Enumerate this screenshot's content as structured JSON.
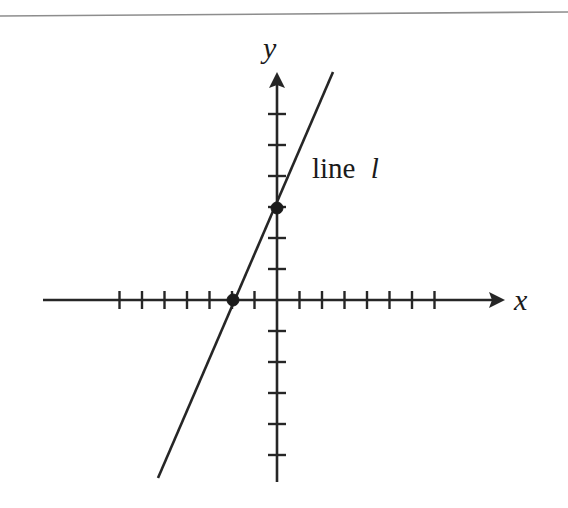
{
  "figure": {
    "kind": "coordinate-plane-line-graph",
    "background_color": "#ffffff",
    "ink_color": "#262626",
    "top_rule": {
      "present": true,
      "color": "#8d8d8d",
      "x1": 0,
      "y1": 16,
      "x2": 568,
      "y2": 12
    },
    "axes": {
      "x_axis": {
        "label": "x",
        "label_x": 514,
        "label_y": 310,
        "line_x1": 43,
        "line_x2": 505,
        "y": 300,
        "arrow": "right",
        "tick_spacing": 22.5,
        "ticks_negative": 7,
        "ticks_positive": 7,
        "tick_half_length": 9
      },
      "y_axis": {
        "label": "y",
        "label_x": 263,
        "label_y": 58,
        "line_y1": 72,
        "line_y2": 482,
        "x": 277,
        "arrow": "up",
        "tick_spacing": 31,
        "ticks_positive": 6,
        "ticks_negative": 5,
        "tick_half_length": 9
      },
      "origin": {
        "x": 277,
        "y": 300
      }
    },
    "line": {
      "name": "line l",
      "label_text_roman": "line",
      "label_text_italic": "l",
      "label_x": 312,
      "label_y": 178,
      "x_start": 158,
      "y_start": 478,
      "x_end": 333,
      "y_end": 72,
      "stroke_width": 2.6
    },
    "points": [
      {
        "name": "x-intercept",
        "x": 233,
        "y": 300,
        "radius": 6
      },
      {
        "name": "y-intercept",
        "x": 277,
        "y": 208,
        "radius": 6
      }
    ]
  },
  "chart_data": {
    "type": "line",
    "title": "",
    "xlabel": "x",
    "ylabel": "y",
    "legend": [
      "line l"
    ],
    "grid": false,
    "xlim": [
      -10.4,
      10.1
    ],
    "ylim": [
      -5.9,
      7.4
    ],
    "x_tick_values": [
      -7,
      -6,
      -5,
      -4,
      -3,
      -2,
      -1,
      1,
      2,
      3,
      4,
      5,
      6,
      7
    ],
    "y_tick_values": [
      -5,
      -4,
      -3,
      -2,
      -1,
      1,
      2,
      3,
      4,
      5,
      6
    ],
    "tick_labels_shown": false,
    "series": [
      {
        "name": "line l",
        "slope": 1.5,
        "intercept": 3,
        "equation": "y = 1.5x + 3",
        "x": [
          -5.3,
          2.5
        ],
        "y": [
          -4.95,
          6.75
        ]
      }
    ],
    "annotations": [
      {
        "text": "line l",
        "x": 1.6,
        "y": 4.0
      }
    ],
    "marked_points": [
      {
        "label": "x-intercept",
        "x": -2,
        "y": 0
      },
      {
        "label": "y-intercept",
        "x": 0,
        "y": 3
      }
    ]
  }
}
